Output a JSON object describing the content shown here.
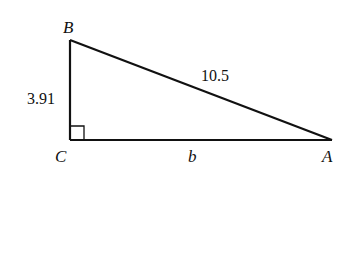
{
  "diagram": {
    "type": "right-triangle",
    "colors": {
      "stroke": "#111111",
      "background": "#ffffff"
    },
    "vertices": {
      "B": {
        "label": "B",
        "x": 70,
        "y": 40
      },
      "C": {
        "label": "C",
        "x": 70,
        "y": 140
      },
      "A": {
        "label": "A",
        "x": 332,
        "y": 140
      }
    },
    "sides": {
      "BC": {
        "label": "3.91"
      },
      "AB": {
        "label": "10.5"
      },
      "CA": {
        "label": "b"
      }
    },
    "right_angle_at": "C"
  }
}
